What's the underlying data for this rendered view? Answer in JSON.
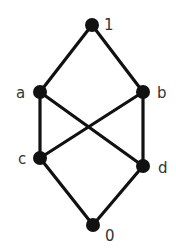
{
  "diagram": {
    "type": "hasse-diagram",
    "colors": {
      "line": "#111111",
      "node": "#111111",
      "label": "#333333",
      "background": "#ffffff"
    },
    "nodes": [
      {
        "id": "1",
        "label": "1",
        "x": 92,
        "y": 25,
        "lx": 104,
        "ly": 30
      },
      {
        "id": "a",
        "label": "a",
        "x": 40,
        "y": 92,
        "lx": 16,
        "ly": 98
      },
      {
        "id": "b",
        "label": "b",
        "x": 143,
        "y": 92,
        "lx": 157,
        "ly": 98
      },
      {
        "id": "c",
        "label": "c",
        "x": 40,
        "y": 158,
        "lx": 18,
        "ly": 164
      },
      {
        "id": "d",
        "label": "d",
        "x": 143,
        "y": 166,
        "lx": 158,
        "ly": 173
      },
      {
        "id": "0",
        "label": "0",
        "x": 93,
        "y": 225,
        "lx": 105,
        "ly": 241
      }
    ],
    "edges": [
      [
        "1",
        "a"
      ],
      [
        "1",
        "b"
      ],
      [
        "a",
        "c"
      ],
      [
        "a",
        "d"
      ],
      [
        "b",
        "c"
      ],
      [
        "b",
        "d"
      ],
      [
        "c",
        "0"
      ],
      [
        "d",
        "0"
      ]
    ]
  }
}
